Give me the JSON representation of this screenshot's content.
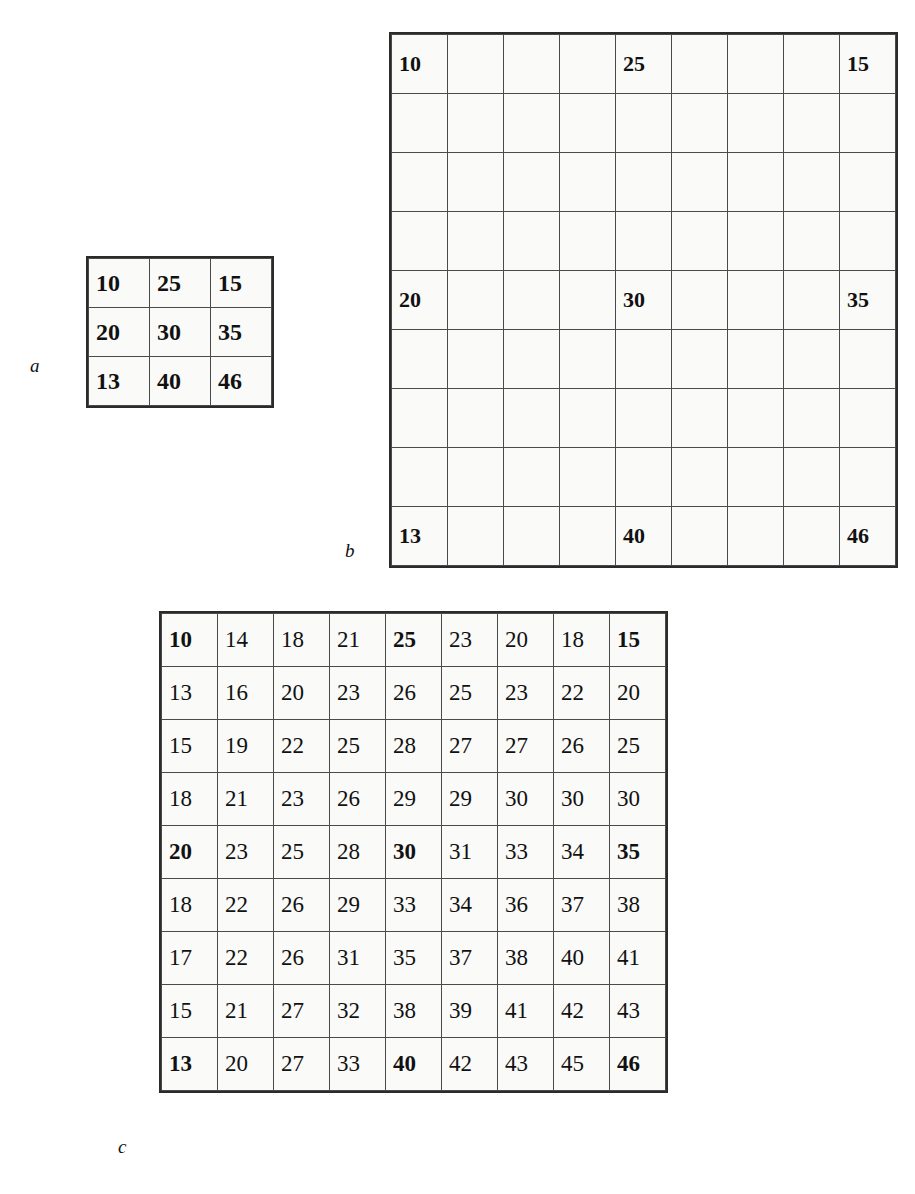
{
  "figure": {
    "panels": [
      {
        "id": "a",
        "label": "a",
        "caption_label": "a",
        "rows": 3,
        "cols": 3,
        "cells": [
          [
            "10",
            "25",
            "15"
          ],
          [
            "20",
            "30",
            "35"
          ],
          [
            "13",
            "40",
            "46"
          ]
        ],
        "bold_cells": [
          [
            true,
            true,
            true
          ],
          [
            true,
            true,
            true
          ],
          [
            true,
            true,
            true
          ]
        ]
      },
      {
        "id": "b",
        "label": "b",
        "caption_label": "b",
        "rows": 9,
        "cols": 9,
        "cells": [
          [
            "10",
            "",
            "",
            "",
            "25",
            "",
            "",
            "",
            "15"
          ],
          [
            "",
            "",
            "",
            "",
            "",
            "",
            "",
            "",
            ""
          ],
          [
            "",
            "",
            "",
            "",
            "",
            "",
            "",
            "",
            ""
          ],
          [
            "",
            "",
            "",
            "",
            "",
            "",
            "",
            "",
            ""
          ],
          [
            "20",
            "",
            "",
            "",
            "30",
            "",
            "",
            "",
            "35"
          ],
          [
            "",
            "",
            "",
            "",
            "",
            "",
            "",
            "",
            ""
          ],
          [
            "",
            "",
            "",
            "",
            "",
            "",
            "",
            "",
            ""
          ],
          [
            "",
            "",
            "",
            "",
            "",
            "",
            "",
            "",
            ""
          ],
          [
            "13",
            "",
            "",
            "",
            "40",
            "",
            "",
            "",
            "46"
          ]
        ],
        "bold_cells": [
          [
            true,
            false,
            false,
            false,
            true,
            false,
            false,
            false,
            true
          ],
          [
            false,
            false,
            false,
            false,
            false,
            false,
            false,
            false,
            false
          ],
          [
            false,
            false,
            false,
            false,
            false,
            false,
            false,
            false,
            false
          ],
          [
            false,
            false,
            false,
            false,
            false,
            false,
            false,
            false,
            false
          ],
          [
            true,
            false,
            false,
            false,
            true,
            false,
            false,
            false,
            true
          ],
          [
            false,
            false,
            false,
            false,
            false,
            false,
            false,
            false,
            false
          ],
          [
            false,
            false,
            false,
            false,
            false,
            false,
            false,
            false,
            false
          ],
          [
            false,
            false,
            false,
            false,
            false,
            false,
            false,
            false,
            false
          ],
          [
            true,
            false,
            false,
            false,
            true,
            false,
            false,
            false,
            true
          ]
        ]
      },
      {
        "id": "c",
        "label": "c",
        "caption_label": "c",
        "rows": 9,
        "cols": 9,
        "cells": [
          [
            "10",
            "14",
            "18",
            "21",
            "25",
            "23",
            "20",
            "18",
            "15"
          ],
          [
            "13",
            "16",
            "20",
            "23",
            "26",
            "25",
            "23",
            "22",
            "20"
          ],
          [
            "15",
            "19",
            "22",
            "25",
            "28",
            "27",
            "27",
            "26",
            "25"
          ],
          [
            "18",
            "21",
            "23",
            "26",
            "29",
            "29",
            "30",
            "30",
            "30"
          ],
          [
            "20",
            "23",
            "25",
            "28",
            "30",
            "31",
            "33",
            "34",
            "35"
          ],
          [
            "18",
            "22",
            "26",
            "29",
            "33",
            "34",
            "36",
            "37",
            "38"
          ],
          [
            "17",
            "22",
            "26",
            "31",
            "35",
            "37",
            "38",
            "40",
            "41"
          ],
          [
            "15",
            "21",
            "27",
            "32",
            "38",
            "39",
            "41",
            "42",
            "43"
          ],
          [
            "13",
            "20",
            "27",
            "33",
            "40",
            "42",
            "43",
            "45",
            "46"
          ]
        ],
        "bold_cells": [
          [
            true,
            false,
            false,
            false,
            true,
            false,
            false,
            false,
            true
          ],
          [
            false,
            false,
            false,
            false,
            false,
            false,
            false,
            false,
            false
          ],
          [
            false,
            false,
            false,
            false,
            false,
            false,
            false,
            false,
            false
          ],
          [
            false,
            false,
            false,
            false,
            false,
            false,
            false,
            false,
            false
          ],
          [
            true,
            false,
            false,
            false,
            true,
            false,
            false,
            false,
            true
          ],
          [
            false,
            false,
            false,
            false,
            false,
            false,
            false,
            false,
            false
          ],
          [
            false,
            false,
            false,
            false,
            false,
            false,
            false,
            false,
            false
          ],
          [
            false,
            false,
            false,
            false,
            false,
            false,
            false,
            false,
            false
          ],
          [
            true,
            false,
            false,
            false,
            true,
            false,
            false,
            false,
            true
          ]
        ]
      }
    ]
  },
  "colors": {
    "page_background": "#ffffff",
    "cell_background": "#fafaf8",
    "inner_border": "#4a4a4a",
    "outer_border": "#2b2b2b",
    "text": "#111111"
  }
}
